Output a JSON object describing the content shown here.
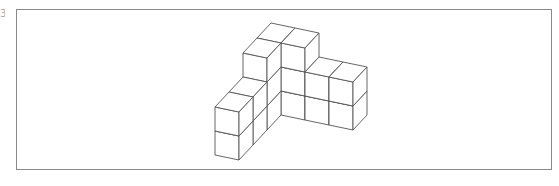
{
  "label_fragment": "3",
  "figure": {
    "type": "isometric-cube-structure",
    "stroke_color": "#555555",
    "fill_color": "#ffffff",
    "frame_color": "#8a8a8a",
    "origin": [
      243,
      53
    ],
    "vector_width": [
      24,
      5
    ],
    "vector_depth": [
      14,
      -15
    ],
    "vector_height": [
      0,
      24
    ],
    "cubes": [
      {
        "x": 0,
        "d": 1,
        "level": 0
      },
      {
        "x": 0,
        "d": 1,
        "level": 1
      },
      {
        "x": 0,
        "d": 1,
        "level": 2
      },
      {
        "x": 1,
        "d": 1,
        "level": 0
      },
      {
        "x": 1,
        "d": 1,
        "level": 1
      },
      {
        "x": 1,
        "d": 1,
        "level": 2
      },
      {
        "x": 2,
        "d": 1,
        "level": 1
      },
      {
        "x": 2,
        "d": 1,
        "level": 2
      },
      {
        "x": 3,
        "d": 1,
        "level": 1
      },
      {
        "x": 3,
        "d": 1,
        "level": 2
      },
      {
        "x": 0,
        "d": 0,
        "level": 0
      },
      {
        "x": 0,
        "d": 0,
        "level": 1
      },
      {
        "x": 0,
        "d": 0,
        "level": 2
      },
      {
        "x": 0,
        "d": -1,
        "level": 1
      },
      {
        "x": 0,
        "d": -1,
        "level": 2
      },
      {
        "x": 0,
        "d": -2,
        "level": 1
      },
      {
        "x": 0,
        "d": -2,
        "level": 2
      }
    ],
    "cube_count": 17
  }
}
